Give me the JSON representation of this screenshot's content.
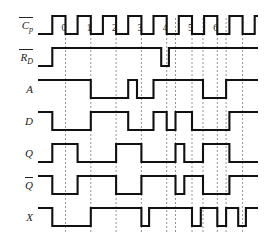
{
  "diagram": {
    "type": "digital-timing-diagram",
    "title": "",
    "background_color": "#ffffff",
    "waveform_color": "#111111",
    "guide_color": "#8a8a8a",
    "label_color": "#222222",
    "rows": [
      {
        "id": "clock",
        "label": "C",
        "subscript": "p",
        "overline": true,
        "label_full": "Cp-bar",
        "description": "inverted clock pulse train, active-low pulses numbered 0 through 6"
      },
      {
        "id": "reset",
        "label": "R",
        "subscript": "D",
        "overline": true,
        "label_full": "RD-bar",
        "description": "asynchronous direct reset, active low; starts low then high with one narrow low glitch near pulse 4"
      },
      {
        "id": "a",
        "label": "A",
        "subscript": "",
        "overline": false,
        "label_full": "A",
        "description": "input A"
      },
      {
        "id": "d",
        "label": "D",
        "subscript": "",
        "overline": false,
        "label_full": "D",
        "description": "data input D"
      },
      {
        "id": "q",
        "label": "Q",
        "subscript": "",
        "overline": false,
        "label_full": "Q",
        "description": "flip-flop output Q"
      },
      {
        "id": "qbar",
        "label": "Q",
        "subscript": "",
        "overline": true,
        "label_full": "Q-bar",
        "description": "complement output Q-bar"
      },
      {
        "id": "x",
        "label": "X",
        "subscript": "",
        "overline": false,
        "label_full": "X",
        "description": "output X"
      }
    ],
    "clock_pulse_labels": [
      "0",
      "1",
      "2",
      "3",
      "4",
      "5",
      "6"
    ],
    "guide_line_count": 11
  },
  "chart_data": {
    "type": "line",
    "xlabel": "time",
    "ylabel": "logic level",
    "x_range": [
      0,
      100
    ],
    "logic_levels": {
      "low": 0,
      "high": 1
    },
    "grid": "vertical dashed guide lines at clock falling edges",
    "legend": "none",
    "guides": [
      12.5,
      24.0,
      35.5,
      47.0,
      58.5,
      62.5,
      70.0,
      75.0,
      81.5,
      85.5,
      93.0
    ],
    "clock_pulses": [
      {
        "label": "0",
        "rise": 11.0,
        "fall": 12.5
      },
      {
        "label": "1",
        "rise": 22.5,
        "fall": 24.0
      },
      {
        "label": "2",
        "rise": 34.0,
        "fall": 35.5
      },
      {
        "label": "3",
        "rise": 45.5,
        "fall": 47.0
      },
      {
        "label": "4",
        "rise": 57.0,
        "fall": 58.5
      },
      {
        "label": "5",
        "rise": 68.5,
        "fall": 70.0
      },
      {
        "label": "6",
        "rise": 80.0,
        "fall": 81.5
      }
    ],
    "series": [
      {
        "name": "Cp-bar",
        "row": "clock",
        "transitions": [
          {
            "x": 0.0,
            "level": 0
          },
          {
            "x": 6.5,
            "level": 1
          },
          {
            "x": 12.5,
            "level": 0
          },
          {
            "x": 18.0,
            "level": 1
          },
          {
            "x": 24.0,
            "level": 0
          },
          {
            "x": 29.5,
            "level": 1
          },
          {
            "x": 35.5,
            "level": 0
          },
          {
            "x": 41.0,
            "level": 1
          },
          {
            "x": 47.0,
            "level": 0
          },
          {
            "x": 52.5,
            "level": 1
          },
          {
            "x": 58.5,
            "level": 0
          },
          {
            "x": 64.0,
            "level": 1
          },
          {
            "x": 70.0,
            "level": 0
          },
          {
            "x": 75.5,
            "level": 1
          },
          {
            "x": 81.5,
            "level": 0
          },
          {
            "x": 87.0,
            "level": 1
          },
          {
            "x": 93.0,
            "level": 0
          },
          {
            "x": 98.5,
            "level": 1
          },
          {
            "x": 100.0,
            "level": 1
          }
        ]
      },
      {
        "name": "RD-bar",
        "row": "reset",
        "transitions": [
          {
            "x": 0.0,
            "level": 0
          },
          {
            "x": 6.5,
            "level": 1
          },
          {
            "x": 56.0,
            "level": 0
          },
          {
            "x": 59.5,
            "level": 1
          },
          {
            "x": 100.0,
            "level": 1
          }
        ]
      },
      {
        "name": "A",
        "row": "a",
        "transitions": [
          {
            "x": 0.0,
            "level": 1
          },
          {
            "x": 24.0,
            "level": 0
          },
          {
            "x": 41.0,
            "level": 1
          },
          {
            "x": 45.0,
            "level": 0
          },
          {
            "x": 52.5,
            "level": 1
          },
          {
            "x": 75.0,
            "level": 0
          },
          {
            "x": 85.5,
            "level": 1
          },
          {
            "x": 100.0,
            "level": 1
          }
        ]
      },
      {
        "name": "D",
        "row": "d",
        "transitions": [
          {
            "x": 0.0,
            "level": 1
          },
          {
            "x": 6.5,
            "level": 0
          },
          {
            "x": 24.0,
            "level": 1
          },
          {
            "x": 41.0,
            "level": 0
          },
          {
            "x": 52.5,
            "level": 1
          },
          {
            "x": 58.5,
            "level": 0
          },
          {
            "x": 62.5,
            "level": 1
          },
          {
            "x": 70.0,
            "level": 0
          },
          {
            "x": 87.0,
            "level": 1
          },
          {
            "x": 100.0,
            "level": 1
          }
        ]
      },
      {
        "name": "Q",
        "row": "q",
        "transitions": [
          {
            "x": 0.0,
            "level": 0
          },
          {
            "x": 6.5,
            "level": 1
          },
          {
            "x": 18.0,
            "level": 0
          },
          {
            "x": 35.5,
            "level": 1
          },
          {
            "x": 47.0,
            "level": 0
          },
          {
            "x": 62.5,
            "level": 1
          },
          {
            "x": 66.5,
            "level": 0
          },
          {
            "x": 75.0,
            "level": 1
          },
          {
            "x": 87.0,
            "level": 0
          },
          {
            "x": 100.0,
            "level": 0
          }
        ]
      },
      {
        "name": "Q-bar",
        "row": "qbar",
        "transitions": [
          {
            "x": 0.0,
            "level": 1
          },
          {
            "x": 6.5,
            "level": 0
          },
          {
            "x": 18.0,
            "level": 1
          },
          {
            "x": 35.5,
            "level": 0
          },
          {
            "x": 47.0,
            "level": 1
          },
          {
            "x": 62.5,
            "level": 0
          },
          {
            "x": 66.5,
            "level": 1
          },
          {
            "x": 75.0,
            "level": 0
          },
          {
            "x": 87.0,
            "level": 1
          },
          {
            "x": 100.0,
            "level": 1
          }
        ]
      },
      {
        "name": "X",
        "row": "x",
        "transitions": [
          {
            "x": 0.0,
            "level": 1
          },
          {
            "x": 6.5,
            "level": 0
          },
          {
            "x": 24.0,
            "level": 1
          },
          {
            "x": 47.0,
            "level": 0
          },
          {
            "x": 50.5,
            "level": 1
          },
          {
            "x": 70.0,
            "level": 0
          },
          {
            "x": 74.0,
            "level": 1
          },
          {
            "x": 81.5,
            "level": 0
          },
          {
            "x": 85.5,
            "level": 1
          },
          {
            "x": 91.0,
            "level": 0
          },
          {
            "x": 94.5,
            "level": 1
          },
          {
            "x": 100.0,
            "level": 1
          }
        ]
      }
    ]
  }
}
